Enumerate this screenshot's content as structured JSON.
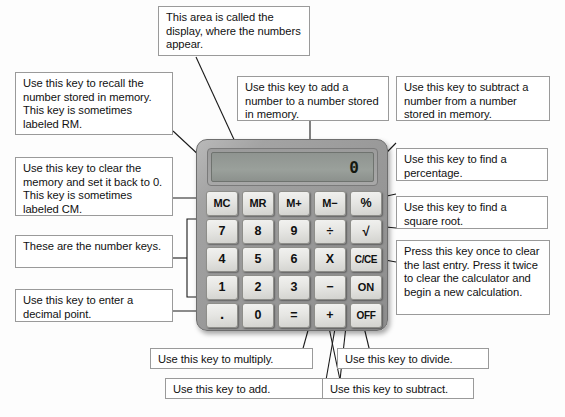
{
  "diagram": {
    "background_color": "#fdfdfd",
    "callout_border_color": "#9a9a9a",
    "leader_line_color": "#1a1a1a"
  },
  "calculator": {
    "body_color": "#9a9a9a",
    "key_color": "#e8e8e5",
    "display": {
      "value": "0",
      "screen_color": "#969b97"
    },
    "keys": [
      {
        "label": "MC",
        "name": "key-memory-clear",
        "size": "small"
      },
      {
        "label": "MR",
        "name": "key-memory-recall",
        "size": "small"
      },
      {
        "label": "M+",
        "name": "key-memory-add",
        "size": "small"
      },
      {
        "label": "M−",
        "name": "key-memory-subtract",
        "size": "small"
      },
      {
        "label": "%",
        "name": "key-percent",
        "size": "normal"
      },
      {
        "label": "7",
        "name": "key-7",
        "size": "normal"
      },
      {
        "label": "8",
        "name": "key-8",
        "size": "normal"
      },
      {
        "label": "9",
        "name": "key-9",
        "size": "normal"
      },
      {
        "label": "÷",
        "name": "key-divide",
        "size": "normal"
      },
      {
        "label": "√",
        "name": "key-square-root",
        "size": "sqrt"
      },
      {
        "label": "4",
        "name": "key-4",
        "size": "normal"
      },
      {
        "label": "5",
        "name": "key-5",
        "size": "normal"
      },
      {
        "label": "6",
        "name": "key-6",
        "size": "normal"
      },
      {
        "label": "X",
        "name": "key-multiply",
        "size": "normal"
      },
      {
        "label": "C/CE",
        "name": "key-clear-entry",
        "size": "tiny"
      },
      {
        "label": "1",
        "name": "key-1",
        "size": "normal"
      },
      {
        "label": "2",
        "name": "key-2",
        "size": "normal"
      },
      {
        "label": "3",
        "name": "key-3",
        "size": "normal"
      },
      {
        "label": "−",
        "name": "key-subtract",
        "size": "normal"
      },
      {
        "label": "ON",
        "name": "key-on",
        "size": "small"
      },
      {
        "label": ".",
        "name": "key-decimal-point",
        "size": "dot"
      },
      {
        "label": "0",
        "name": "key-0",
        "size": "normal"
      },
      {
        "label": "=",
        "name": "key-equals",
        "size": "normal"
      },
      {
        "label": "+",
        "name": "key-add",
        "size": "normal"
      },
      {
        "label": "OFF",
        "name": "key-off",
        "size": "tiny"
      }
    ]
  },
  "callouts": {
    "display": "This area is called the display, where the numbers appear.",
    "memory_recall": "Use this key to recall the number stored in memory. This key is sometimes labeled RM.",
    "memory_add": "Use this key to add a number to a number stored in memory.",
    "memory_subtract": "Use this key to subtract a number from a number stored in memory.",
    "memory_clear": "Use this key to clear the memory and set it back to 0. This key is sometimes labeled CM.",
    "percent": "Use this key to find a percentage.",
    "square_root": "Use this key to find a square root.",
    "number_keys": "These are the number keys.",
    "clear_entry": "Press this key once to clear the last entry. Press it twice to clear the calculator and begin a new calculation.",
    "decimal_point": "Use this key to enter a decimal point.",
    "multiply": "Use this key to multiply.",
    "add": "Use this key to add.",
    "divide": "Use this key to divide.",
    "subtract": "Use this key to subtract."
  }
}
